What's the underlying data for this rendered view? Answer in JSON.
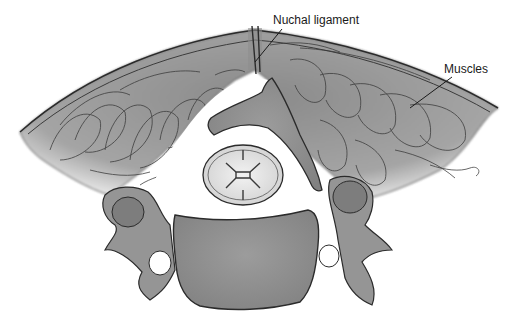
{
  "figure": {
    "style": "pencil-shaded grayscale illustration"
  },
  "labels": [
    {
      "id": "nuchal",
      "text": "Nuchal ligament",
      "points_to": "midline posterior band above spinous process"
    },
    {
      "id": "muscles",
      "text": "Muscles",
      "points_to": "posterior paraspinal muscle mass (right side)"
    }
  ],
  "colors": {
    "background": "#ffffff",
    "bone_fill": "#9a9a9a",
    "bone_dark": "#7d7d7d",
    "muscle_fill": "#8f8f8f",
    "outline": "#2b2b2b",
    "cord_fill": "#e4e4e4"
  }
}
